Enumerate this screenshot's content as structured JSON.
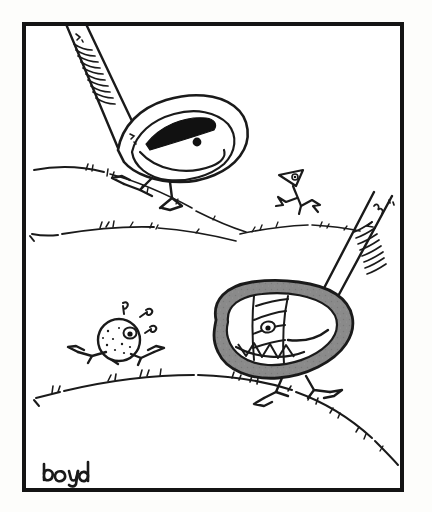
{
  "artwork": {
    "title": "Golf Club Cartoon",
    "medium": "pen-and-ink line drawing",
    "signature": "boyd",
    "background_color": "#fdfdfb",
    "paper_color": "#ffffff",
    "ink_color": "#1a1a1a",
    "frame": {
      "border_color": "#141414",
      "border_width_px": 4,
      "x": 22,
      "y": 22,
      "width": 382,
      "height": 470
    },
    "palette": {
      "ink": "#1a1a1a",
      "driver_head_gray": "#8a8a8a",
      "driver_head_gray_dark": "#6f6f6f",
      "white_fill": "#ffffff",
      "black_fill": "#111111"
    },
    "scene": {
      "setting": "rolling golf course hills",
      "description": "Two anthropomorphic golf clubs with legs chase a running golf ball and a golf tee across hilly fairway ground."
    },
    "characters": [
      {
        "id": "iron-club",
        "name": "Iron Golf Club",
        "fill": "white",
        "position": "upper-left",
        "expression": "sly narrowed eye",
        "features": [
          "wrapped striped grip",
          "cavity-back eye",
          "black wedge pupil",
          "two stick legs",
          "angular feet"
        ]
      },
      {
        "id": "driver-club",
        "name": "Driver / Wood Golf Club",
        "fill": "gray",
        "position": "lower-right",
        "expression": "wide toothy grin",
        "features": [
          "wrapped striped grip",
          "striped face bands",
          "small round eye",
          "zigzag triangle teeth",
          "two stick legs",
          "angular feet"
        ]
      },
      {
        "id": "golf-ball",
        "name": "Golf Ball",
        "fill": "white",
        "position": "lower-left",
        "expression": "panicked, fleeing",
        "features": [
          "dimples",
          "wide eye",
          "running legs",
          "sweat droplets"
        ]
      },
      {
        "id": "golf-tee",
        "name": "Golf Tee",
        "fill": "white",
        "position": "middle-right",
        "expression": "running away",
        "features": [
          "triangular head",
          "small eye",
          "running legs"
        ]
      }
    ],
    "ground_lines": 4
  }
}
